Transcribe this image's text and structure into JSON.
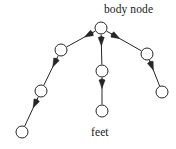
{
  "diagram": {
    "title_label": "body node",
    "bottom_label": "feet",
    "type": "tree-graph",
    "stroke_color": "#262626",
    "node_fill": "#ffffff",
    "node_stroke": "#262626",
    "node_radius": 6,
    "edge_width": 1,
    "nodes": [
      {
        "id": "root",
        "name": "body-node",
        "cx": 101,
        "cy": 28,
        "r": 6
      },
      {
        "id": "l1",
        "name": "left-node-1",
        "cx": 61,
        "cy": 50,
        "r": 6
      },
      {
        "id": "l2",
        "name": "left-node-2",
        "cx": 41,
        "cy": 91,
        "r": 6
      },
      {
        "id": "l3",
        "name": "left-node-3",
        "cx": 22,
        "cy": 132,
        "r": 6
      },
      {
        "id": "m1",
        "name": "middle-node-1",
        "cx": 102,
        "cy": 71,
        "r": 6
      },
      {
        "id": "m2",
        "name": "middle-node-2",
        "cx": 102,
        "cy": 111,
        "r": 6
      },
      {
        "id": "r1",
        "name": "right-node-1",
        "cx": 147,
        "cy": 54,
        "r": 6
      },
      {
        "id": "r2",
        "name": "right-node-2",
        "cx": 162,
        "cy": 92,
        "r": 6
      }
    ],
    "edges": [
      {
        "from": "root",
        "to": "l1",
        "name": "edge-root-to-left-1"
      },
      {
        "from": "l1",
        "to": "l2",
        "name": "edge-left-1-to-left-2"
      },
      {
        "from": "l2",
        "to": "l3",
        "name": "edge-left-2-to-left-3"
      },
      {
        "from": "root",
        "to": "m1",
        "name": "edge-root-to-middle-1"
      },
      {
        "from": "m1",
        "to": "m2",
        "name": "edge-middle-1-to-middle-2"
      },
      {
        "from": "root",
        "to": "r1",
        "name": "edge-root-to-right-1"
      },
      {
        "from": "r1",
        "to": "r2",
        "name": "edge-right-1-to-right-2"
      }
    ]
  }
}
